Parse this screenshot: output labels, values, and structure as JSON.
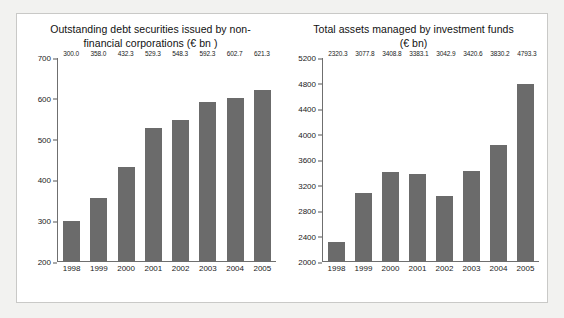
{
  "panel": {
    "background": "#ffffff",
    "border_color": "#c9c9c7",
    "page_background": "#f2f2f0"
  },
  "style": {
    "bar_color": "#6b6b6b",
    "axis_color": "#6f6f6f",
    "text_color": "#1a1a1a"
  },
  "chart_data": [
    {
      "type": "bar",
      "id": "outstanding-debt-securities",
      "title": "Outstanding debt securities issued by non-financial corporations (€ bn )",
      "title_line1": "Outstanding debt securities issued by non-",
      "title_line2": "financial corporations (€ bn )",
      "xlabel": "",
      "ylabel": "",
      "ylim": [
        200,
        700
      ],
      "yticks": [
        200,
        300,
        400,
        500,
        600,
        700
      ],
      "ytick_labels": [
        "200",
        "300",
        "400",
        "500",
        "600",
        "700"
      ],
      "grid": false,
      "legend": false,
      "categories": [
        "1998",
        "1999",
        "2000",
        "2001",
        "2002",
        "2003",
        "2004",
        "2005"
      ],
      "values": [
        300.0,
        358.0,
        432.3,
        529.3,
        548.3,
        592.3,
        602.7,
        621.3
      ],
      "data_labels": [
        "300.0",
        "358.0",
        "432.3",
        "529.3",
        "548.3",
        "592.3",
        "602.7",
        "621.3"
      ]
    },
    {
      "type": "bar",
      "id": "total-assets-investment-funds",
      "title": "Total assets managed by investment funds (€ bn)",
      "title_line1": "Total assets managed by investment funds",
      "title_line2": "(€ bn)",
      "xlabel": "",
      "ylabel": "",
      "ylim": [
        2000,
        5200
      ],
      "yticks": [
        2000,
        2400,
        2800,
        3200,
        3600,
        4000,
        4400,
        4800,
        5200
      ],
      "ytick_labels": [
        "2000",
        "2400",
        "2800",
        "3200",
        "3600",
        "4000",
        "4400",
        "4800",
        "5200"
      ],
      "grid": false,
      "legend": false,
      "categories": [
        "1998",
        "1999",
        "2000",
        "2001",
        "2002",
        "2003",
        "2004",
        "2005"
      ],
      "values": [
        2320.3,
        3077.8,
        3408.8,
        3383.1,
        3042.9,
        3420.6,
        3830.2,
        4793.3
      ],
      "data_labels": [
        "2320.3",
        "3077.8",
        "3408.8",
        "3383.1",
        "3042.9",
        "3420.6",
        "3830.2",
        "4793.3"
      ]
    }
  ]
}
